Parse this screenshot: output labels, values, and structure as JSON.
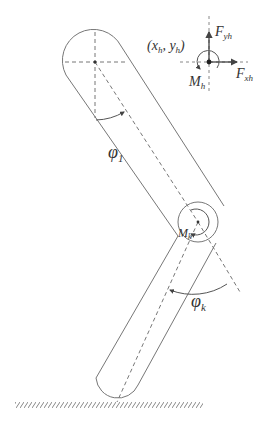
{
  "diagram": {
    "type": "two-link leg model",
    "colors": {
      "line": "#777777",
      "label": "#333333",
      "background": "#ffffff"
    },
    "labels": {
      "hip_coord": "(x",
      "hip_coord_sub_x": "h",
      "hip_coord_mid": ", y",
      "hip_coord_sub_y": "h",
      "hip_coord_end": ")",
      "fy_main": "F",
      "fy_sub": "yh",
      "fx_main": "F",
      "fx_sub": "xh",
      "mh_main": "M",
      "mh_sub": "h",
      "mk_main": "M",
      "mk_sub": "k",
      "phi1_main": "φ",
      "phi1_sub": "1",
      "phik_main": "φ",
      "phik_sub": "k"
    },
    "elements": [
      "thigh-segment",
      "shank-segment",
      "hip-joint",
      "knee-joint",
      "ground"
    ]
  }
}
